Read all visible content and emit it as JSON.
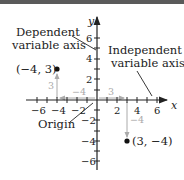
{
  "diagram": {
    "axes": {
      "x_label": "x",
      "y_label": "y",
      "x_ticks": [
        -6,
        -4,
        -2,
        2,
        4,
        6
      ],
      "y_ticks": [
        6,
        4,
        2,
        -2,
        -4,
        -6
      ],
      "x_tick_labels": [
        "−6",
        "−4",
        "−2",
        "2",
        "4",
        "6"
      ],
      "y_tick_labels": [
        "6",
        "4",
        "2",
        "−2",
        "−4",
        "−6"
      ]
    },
    "callouts": {
      "dependent": [
        "Dependent",
        "variable axis"
      ],
      "independent": [
        "Independent",
        "variable axis"
      ],
      "origin": "Origin"
    },
    "points": [
      {
        "label": "(−4, 3)",
        "x": -4,
        "y": 3,
        "path_labels": [
          "−4",
          "3"
        ]
      },
      {
        "label": "(3, −4)",
        "x": 3,
        "y": -4,
        "path_labels": [
          "3",
          "−4"
        ]
      }
    ],
    "colors": {
      "ink": "#222222",
      "path": "#aaaaaa",
      "topbar": "#5a5a5a"
    }
  }
}
